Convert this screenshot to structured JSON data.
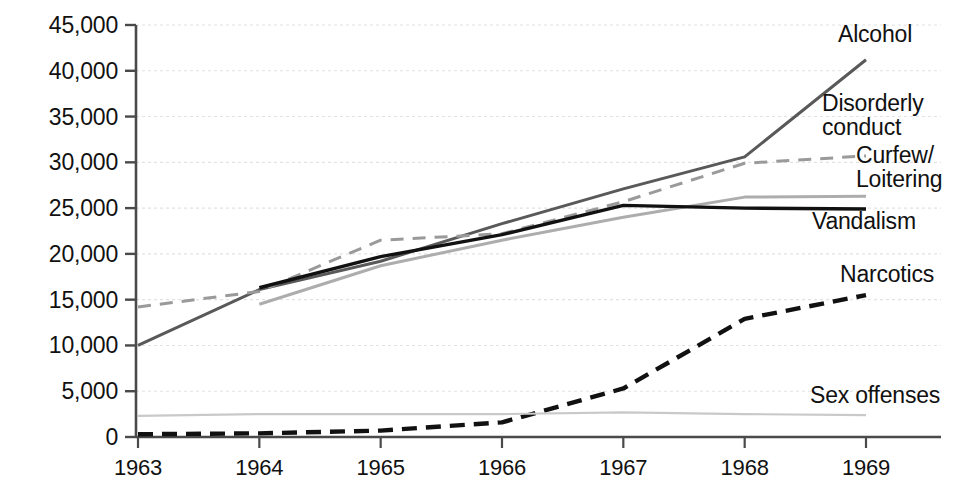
{
  "chart_data": {
    "type": "line",
    "title": "",
    "xlabel": "",
    "ylabel": "",
    "categories": [
      "1963",
      "1964",
      "1965",
      "1966",
      "1967",
      "1968",
      "1969"
    ],
    "x": [
      1963,
      1964,
      1965,
      1966,
      1967,
      1968,
      1969
    ],
    "xlim": [
      1963,
      1969
    ],
    "ylim": [
      0,
      45000
    ],
    "grid": true,
    "legend_position": "right-inline-labels",
    "yticks": [
      0,
      5000,
      10000,
      15000,
      20000,
      25000,
      30000,
      35000,
      40000,
      45000
    ],
    "ytick_labels": [
      "0",
      "5,000",
      "10,000",
      "15,000",
      "20,000",
      "25,000",
      "30,000",
      "35,000",
      "40,000",
      "45,000"
    ],
    "series": [
      {
        "name": "Alcohol",
        "values": [
          10000,
          16100,
          19200,
          23300,
          27100,
          30600,
          41200
        ],
        "color": "#595959",
        "style": "solid",
        "width": 3.0,
        "label_x": 872,
        "label_y": 22
      },
      {
        "name": "Disorderly conduct",
        "values": [
          null,
          14500,
          18700,
          21500,
          24000,
          26200,
          26300
        ],
        "color": "#adadad",
        "style": "solid",
        "width": 3.0,
        "label_x": 822,
        "label_y": 92
      },
      {
        "name": "Curfew/ Loitering",
        "values": [
          14200,
          15900,
          21500,
          22200,
          25700,
          29900,
          30700
        ],
        "color": "#9a9a9a",
        "style": "dashed",
        "width": 3.0,
        "label_x": 856,
        "label_y": 144
      },
      {
        "name": "Vandalism",
        "values": [
          null,
          16300,
          19700,
          22100,
          25300,
          25000,
          24900
        ],
        "color": "#111111",
        "style": "solid",
        "width": 3.4,
        "label_x": 812,
        "label_y": 209
      },
      {
        "name": "Narcotics",
        "values": [
          300,
          400,
          700,
          1600,
          5300,
          12900,
          15500
        ],
        "color": "#111111",
        "style": "dashed-bold",
        "width": 4.4,
        "label_x": 840,
        "label_y": 262
      },
      {
        "name": "Sex offenses",
        "values": [
          2300,
          2500,
          2500,
          2500,
          2700,
          2500,
          2400
        ],
        "color": "#c9c9c9",
        "style": "solid",
        "width": 2.2,
        "label_x": 810,
        "label_y": 383
      }
    ]
  },
  "axis": {
    "y_labels": [
      "45,000",
      "40,000",
      "35,000",
      "30,000",
      "25,000",
      "20,000",
      "15,000",
      "10,000",
      "5,000",
      "0"
    ],
    "x_labels": [
      "1963",
      "1964",
      "1965",
      "1966",
      "1967",
      "1968",
      "1969"
    ],
    "axis_color": "#4a4a4a",
    "grid_color": "#e2e2e2"
  },
  "labels": {
    "alcohol": "Alcohol",
    "disorderly_line1": "Disorderly",
    "disorderly_line2": "conduct",
    "curfew_line1": "Curfew/",
    "curfew_line2": "Loitering",
    "vandalism": "Vandalism",
    "narcotics": "Narcotics",
    "sex_offenses": "Sex offenses"
  }
}
